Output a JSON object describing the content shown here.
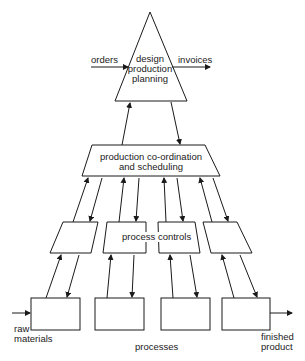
{
  "diagram": {
    "planning": {
      "label_line1": "design",
      "label_line2": "production",
      "label_line3": "planning"
    },
    "inputs": {
      "orders": "orders",
      "invoices": "invoices"
    },
    "coordination": {
      "label_line1": "production co-ordination",
      "label_line2": "and scheduling"
    },
    "controls": {
      "label": "process controls",
      "count": 4
    },
    "processes": {
      "label": "processes",
      "count": 4
    },
    "raw_materials": {
      "line1": "raw",
      "line2": "materials"
    },
    "finished_product": {
      "line1": "finished",
      "line2": "product"
    }
  }
}
